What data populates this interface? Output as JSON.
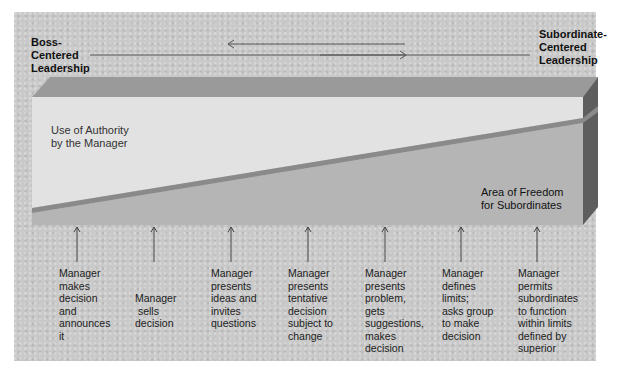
{
  "diagram": {
    "title_left": [
      "Boss-",
      "Centered",
      "Leadership"
    ],
    "title_right": [
      "Subordinate-",
      "Centered",
      "Leadership"
    ],
    "region_top_label": [
      "Use of Authority",
      "by the Manager"
    ],
    "region_bottom_label": [
      "Area of Freedom",
      "for Subordinates"
    ],
    "behaviors": [
      {
        "lines": [
          "Manager",
          "makes",
          "decision",
          "and",
          "announces",
          "it"
        ]
      },
      {
        "lines": [
          "Manager",
          " sells",
          "decision"
        ]
      },
      {
        "lines": [
          "Manager",
          "presents",
          "ideas and",
          "invites",
          "questions"
        ]
      },
      {
        "lines": [
          "Manager",
          "presents",
          "tentative",
          "decision",
          "subject to",
          "change"
        ]
      },
      {
        "lines": [
          "Manager",
          "presents",
          "problem,",
          "gets",
          "suggestions,",
          "makes",
          "decision"
        ]
      },
      {
        "lines": [
          "Manager",
          "defines",
          "limits;",
          "asks group",
          "to make",
          "decision"
        ]
      },
      {
        "lines": [
          "Manager",
          "permits",
          "subordinates",
          "to function",
          "within limits",
          "defined by",
          "superior"
        ]
      }
    ],
    "colors": {
      "background": "#c9c9c9",
      "top_face": "#9a9a9a",
      "authority_area": "#e2e2e2",
      "freedom_area": "#b5b5b5",
      "stripe": "#8a8a8a",
      "side_face": "#5e5e5e"
    }
  }
}
